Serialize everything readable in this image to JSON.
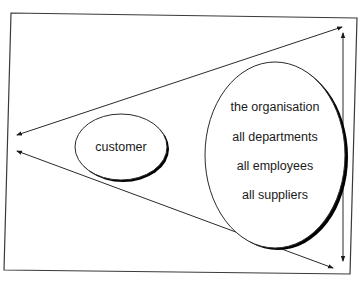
{
  "diagram": {
    "type": "customer-focus funnel",
    "frame": {
      "points": [
        [
          11,
          13
        ],
        [
          357,
          18
        ],
        [
          350,
          274
        ],
        [
          4,
          270
        ]
      ],
      "stroke": "#3a3a3a"
    },
    "nodes": {
      "customer": {
        "label": "customer",
        "cx": 121,
        "cy": 147,
        "rx": 46,
        "ry": 33
      },
      "organisation": {
        "cx": 275,
        "cy": 155,
        "rx": 70,
        "ry": 93,
        "lines": [
          "the organisation",
          "all departments",
          "all employees",
          "all suppliers"
        ]
      }
    },
    "arrows": [
      {
        "name": "upper-diagonal",
        "from": [
          342,
          27
        ],
        "to": [
          17,
          135
        ],
        "heads": "both"
      },
      {
        "name": "lower-diagonal",
        "from": [
          17,
          151
        ],
        "to": [
          333,
          268
        ],
        "heads": "both"
      },
      {
        "name": "vertical-span",
        "from": [
          343,
          33
        ],
        "to": [
          343,
          261
        ],
        "heads": "both"
      }
    ],
    "colors": {
      "line": "#2a2a2a",
      "shadow": "#000000",
      "text": "#1a1a1a",
      "background": "#ffffff"
    }
  }
}
